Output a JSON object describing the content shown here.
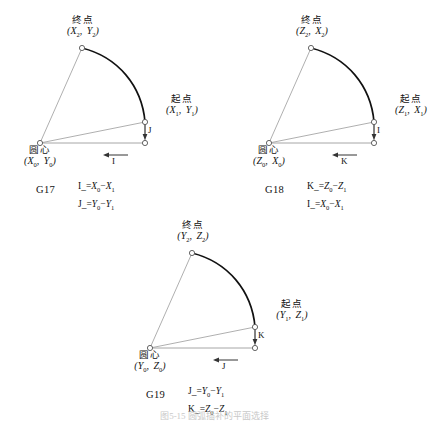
{
  "figure": {
    "bottom_caption": "图5-15  圆弧插补的平面选择",
    "colors": {
      "arc_stroke": "#111111",
      "radius_line": "#9a9a9a",
      "axis_line": "#8f8f8f",
      "marker_stroke": "#555555",
      "text": "#111111"
    }
  },
  "diagrams": [
    {
      "id": "g17",
      "plane_label": "G17",
      "end_point": {
        "name": "终点",
        "coord_open": "(",
        "first": "X",
        "first_sub": "2",
        "sep": ",",
        "second": "Y",
        "second_sub": "2",
        "coord_close": ")"
      },
      "start_point": {
        "name": "起点",
        "coord_open": "(",
        "first": "X",
        "first_sub": "1",
        "sep": ",",
        "second": "Y",
        "second_sub": "1",
        "coord_close": ")"
      },
      "center_point": {
        "name": "圆心",
        "coord_open": "(",
        "first": "X",
        "first_sub": "0",
        "sep": ",",
        "second": "Y",
        "second_sub": "0",
        "coord_close": ")"
      },
      "vertical_arrow_label": "J",
      "horizontal_arrow_label": "I",
      "formulas": [
        {
          "lhs": "I",
          "underscore": "_",
          "eq": "=",
          "a": "X",
          "a_sub": "0",
          "minus": "−",
          "b": "X",
          "b_sub": "1"
        },
        {
          "lhs": "J",
          "underscore": "_",
          "eq": "=",
          "a": "Y",
          "a_sub": "0",
          "minus": "−",
          "b": "Y",
          "b_sub": "1"
        }
      ]
    },
    {
      "id": "g18",
      "plane_label": "G18",
      "end_point": {
        "name": "终点",
        "coord_open": "(",
        "first": "Z",
        "first_sub": "2",
        "sep": ",",
        "second": "X",
        "second_sub": "2",
        "coord_close": ")"
      },
      "start_point": {
        "name": "起点",
        "coord_open": "(",
        "first": "Z",
        "first_sub": "1",
        "sep": ",",
        "second": "X",
        "second_sub": "1",
        "coord_close": ")"
      },
      "center_point": {
        "name": "圆心",
        "coord_open": "(",
        "first": "Z",
        "first_sub": "0",
        "sep": ",",
        "second": "X",
        "second_sub": "0",
        "coord_close": ")"
      },
      "vertical_arrow_label": "I",
      "horizontal_arrow_label": "K",
      "formulas": [
        {
          "lhs": "K",
          "underscore": "_",
          "eq": "=",
          "a": "Z",
          "a_sub": "0",
          "minus": "−",
          "b": "Z",
          "b_sub": "1"
        },
        {
          "lhs": "I",
          "underscore": "_",
          "eq": "=",
          "a": "X",
          "a_sub": "0",
          "minus": "−",
          "b": "X",
          "b_sub": "1"
        }
      ]
    },
    {
      "id": "g19",
      "plane_label": "G19",
      "end_point": {
        "name": "终点",
        "coord_open": "(",
        "first": "Y",
        "first_sub": "2",
        "sep": ",",
        "second": "Z",
        "second_sub": "2",
        "coord_close": ")"
      },
      "start_point": {
        "name": "起点",
        "coord_open": "(",
        "first": "Y",
        "first_sub": "1",
        "sep": ",",
        "second": "Z",
        "second_sub": "1",
        "coord_close": ")"
      },
      "center_point": {
        "name": "圆心",
        "coord_open": "(",
        "first": "Y",
        "first_sub": "0",
        "sep": ",",
        "second": "Z",
        "second_sub": "0",
        "coord_close": ")"
      },
      "vertical_arrow_label": "K",
      "horizontal_arrow_label": "J",
      "formulas": [
        {
          "lhs": "J",
          "underscore": "_",
          "eq": "=",
          "a": "Y",
          "a_sub": "0",
          "minus": "−",
          "b": "Y",
          "b_sub": "1"
        },
        {
          "lhs": "K",
          "underscore": "_",
          "eq": "=",
          "a": "Z",
          "a_sub": "0",
          "minus": "−",
          "b": "Z",
          "b_sub": "1"
        }
      ]
    }
  ]
}
